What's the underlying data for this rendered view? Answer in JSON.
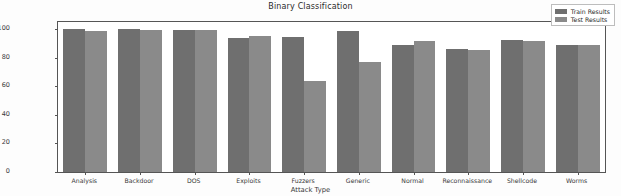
{
  "chart_data": {
    "type": "bar",
    "title": "Binary Classification",
    "xlabel": "Attack Type",
    "ylabel": "Accuracy Percentage",
    "categories": [
      "Analysis",
      "Backdoor",
      "DOS",
      "Exploits",
      "Fuzzers",
      "Generic",
      "Normal",
      "Reconnaissance",
      "Shellcode",
      "Worms"
    ],
    "series": [
      {
        "name": "Train Results",
        "color": "#6f6f6f",
        "values": [
          99.8,
          99.9,
          99.4,
          93.7,
          94.2,
          98.7,
          88.8,
          86.4,
          92.3,
          89.0
        ]
      },
      {
        "name": "Test Results",
        "color": "#8a8a8a",
        "values": [
          98.9,
          99.7,
          99.2,
          95.2,
          63.8,
          76.8,
          91.6,
          85.7,
          91.4,
          88.6
        ]
      }
    ],
    "ylim": [
      0,
      105
    ],
    "yticks": [
      0,
      20,
      40,
      60,
      80,
      100
    ],
    "ytick_labels": [
      "0",
      "20",
      "40",
      "60",
      "80",
      "100"
    ],
    "grid": false,
    "legend_position": "upper right"
  },
  "legend": {
    "entries": [
      {
        "label": "Train Results"
      },
      {
        "label": "Test Results"
      }
    ]
  }
}
